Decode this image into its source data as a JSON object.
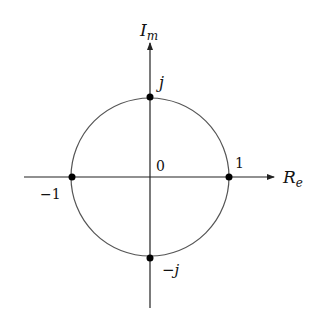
{
  "diagram": {
    "axes": {
      "x_label": "R",
      "x_label_sub": "e",
      "y_label": "I",
      "y_label_sub": "m"
    },
    "origin_label": "0",
    "points": [
      {
        "name": "one",
        "label": "1",
        "re": 1,
        "im": 0
      },
      {
        "name": "minus-one",
        "label": "−1",
        "re": -1,
        "im": 0
      },
      {
        "name": "j",
        "label": "j",
        "re": 0,
        "im": 1
      },
      {
        "name": "minus-j",
        "label": "−j",
        "re": 0,
        "im": -1
      }
    ],
    "colors": {
      "axis": "#222222",
      "circle": "#555555",
      "point": "#000000"
    }
  }
}
